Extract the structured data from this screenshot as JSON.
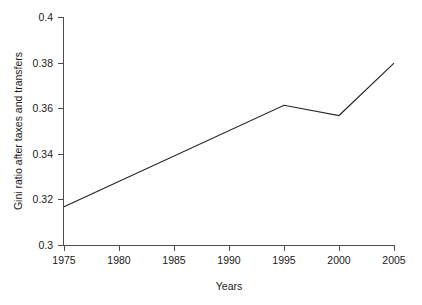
{
  "chart_data": {
    "type": "line",
    "title": "",
    "subtitle": "",
    "xlabel": "Years",
    "ylabel": "Gini ratio after taxes and transfers",
    "x": [
      1975,
      1995,
      2000,
      2005
    ],
    "values": [
      0.317,
      0.3615,
      0.357,
      0.38
    ],
    "series": [
      {
        "name": "Gini ratio after taxes and transfers",
        "x": [
          1975,
          1995,
          2000,
          2005
        ],
        "values": [
          0.317,
          0.3615,
          0.357,
          0.38
        ],
        "color": "#262626"
      }
    ],
    "xlim": [
      1975,
      2005
    ],
    "ylim": [
      0.3,
      0.4
    ],
    "xticks": [
      1975,
      1980,
      1985,
      1990,
      1995,
      2000,
      2005
    ],
    "xtick_labels": [
      "1975",
      "1980",
      "1985",
      "1990",
      "1995",
      "2000",
      "2005"
    ],
    "yticks": [
      0.3,
      0.32,
      0.34,
      0.36,
      0.38,
      0.4
    ],
    "ytick_labels": [
      "0.3",
      "0.32",
      "0.34",
      "0.36",
      "0.38",
      "0.4"
    ],
    "grid": false,
    "legend": false,
    "legend_position": "none",
    "markers": false,
    "spines": [
      "left",
      "bottom"
    ],
    "annotations": []
  },
  "axis": {
    "x_title": "Years",
    "y_title": "Gini ratio after taxes and transfers"
  },
  "xticks": {
    "t0": "1975",
    "t1": "1980",
    "t2": "1985",
    "t3": "1990",
    "t4": "1995",
    "t5": "2000",
    "t6": "2005"
  },
  "yticks": {
    "t0": "0.3",
    "t1": "0.32",
    "t2": "0.34",
    "t3": "0.36",
    "t4": "0.38",
    "t5": "0.4"
  }
}
